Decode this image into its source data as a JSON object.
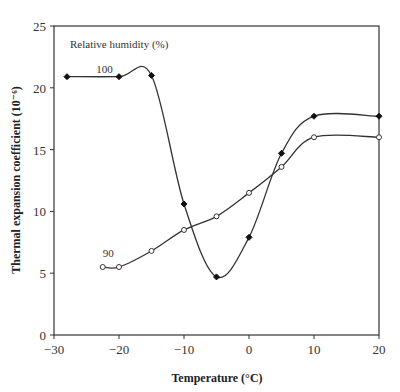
{
  "chart_data": {
    "type": "line",
    "title": "",
    "xlabel": "Temperature (°C)",
    "ylabel": "Thermal expansion coefficient  (10⁻⁶)",
    "xlim": [
      -30,
      20
    ],
    "ylim": [
      0,
      25
    ],
    "xticks": [
      -30,
      -20,
      -10,
      0,
      10,
      20
    ],
    "xtick_labels": [
      "−30",
      "−20",
      "−10",
      "0",
      "10",
      "20"
    ],
    "yticks": [
      0,
      5,
      10,
      15,
      20,
      25
    ],
    "ytick_labels": [
      "0",
      "5",
      "10",
      "15",
      "20",
      "25"
    ],
    "grid": false,
    "legend_title": "Relative humidity (%)",
    "series": [
      {
        "name": "100",
        "marker": "filled-diamond",
        "x": [
          -28,
          -20,
          -15,
          -10,
          -5,
          0,
          5,
          10,
          20
        ],
        "y": [
          20.9,
          20.9,
          21.0,
          10.6,
          4.7,
          7.9,
          14.7,
          17.7,
          17.7
        ]
      },
      {
        "name": "90",
        "marker": "open-circle",
        "x": [
          -22.5,
          -20,
          -15,
          -10,
          -5,
          0,
          5,
          10,
          20
        ],
        "y": [
          5.5,
          5.5,
          6.8,
          8.5,
          9.6,
          11.5,
          13.6,
          16.0,
          16.0
        ]
      }
    ],
    "annotations": [
      {
        "text": "100",
        "x": -23.5,
        "y": 21.2
      },
      {
        "text": "90",
        "x": -22.5,
        "y": 6.3
      }
    ]
  },
  "colors": {
    "line": "#333333",
    "axis": "#333333"
  }
}
